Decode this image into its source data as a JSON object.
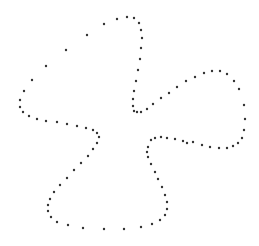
{
  "figure": {
    "dot_color": "#333333",
    "background": "#ffffff",
    "dot_radius": 1.2,
    "dots": [
      [
        127,
        17
      ],
      [
        117,
        19
      ],
      [
        104,
        24
      ],
      [
        87,
        35
      ],
      [
        66,
        50
      ],
      [
        46,
        66
      ],
      [
        32,
        80
      ],
      [
        24,
        91
      ],
      [
        20,
        100
      ],
      [
        20,
        107
      ],
      [
        23,
        112
      ],
      [
        29,
        116
      ],
      [
        37,
        119
      ],
      [
        46,
        121
      ],
      [
        57,
        122
      ],
      [
        67,
        124
      ],
      [
        77,
        126
      ],
      [
        86,
        128
      ],
      [
        93,
        130
      ],
      [
        97,
        133
      ],
      [
        99,
        137
      ],
      [
        97,
        143
      ],
      [
        93,
        149
      ],
      [
        88,
        156
      ],
      [
        81,
        163
      ],
      [
        74,
        170
      ],
      [
        67,
        178
      ],
      [
        60,
        185
      ],
      [
        54,
        192
      ],
      [
        50,
        199
      ],
      [
        48,
        205
      ],
      [
        48,
        211
      ],
      [
        51,
        217
      ],
      [
        57,
        222
      ],
      [
        68,
        225
      ],
      [
        83,
        228
      ],
      [
        104,
        229
      ],
      [
        124,
        229
      ],
      [
        141,
        227
      ],
      [
        152,
        224
      ],
      [
        160,
        220
      ],
      [
        165,
        215
      ],
      [
        167,
        209
      ],
      [
        167,
        202
      ],
      [
        165,
        195
      ],
      [
        162,
        187
      ],
      [
        158,
        179
      ],
      [
        155,
        172
      ],
      [
        151,
        164
      ],
      [
        148,
        157
      ],
      [
        147,
        152
      ],
      [
        148,
        147
      ],
      [
        151,
        140
      ],
      [
        155,
        138
      ],
      [
        161,
        137
      ],
      [
        167,
        138
      ],
      [
        175,
        139
      ],
      [
        183,
        141
      ],
      [
        187,
        143
      ],
      [
        193,
        142
      ],
      [
        202,
        145
      ],
      [
        210,
        147
      ],
      [
        219,
        148
      ],
      [
        227,
        148
      ],
      [
        233,
        146
      ],
      [
        238,
        143
      ],
      [
        242,
        138
      ],
      [
        244,
        130
      ],
      [
        245,
        119
      ],
      [
        244,
        105
      ],
      [
        239,
        89
      ],
      [
        234,
        81
      ],
      [
        227,
        74
      ],
      [
        220,
        71
      ],
      [
        212,
        71
      ],
      [
        204,
        73
      ],
      [
        195,
        77
      ],
      [
        186,
        81
      ],
      [
        177,
        87
      ],
      [
        169,
        93
      ],
      [
        161,
        98
      ],
      [
        153,
        104
      ],
      [
        147,
        109
      ],
      [
        141,
        112
      ],
      [
        137,
        112
      ],
      [
        134,
        111
      ],
      [
        133,
        106
      ],
      [
        133,
        99
      ],
      [
        134,
        91
      ],
      [
        136,
        81
      ],
      [
        138,
        70
      ],
      [
        140,
        59
      ],
      [
        141,
        48
      ],
      [
        142,
        38
      ],
      [
        141,
        30
      ],
      [
        139,
        23
      ],
      [
        134,
        18
      ]
    ]
  }
}
